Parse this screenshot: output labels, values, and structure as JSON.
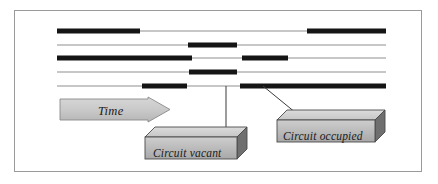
{
  "figure": {
    "type": "timeline-occupancy-diagram",
    "background": "#ffffff",
    "frame": {
      "x": 14,
      "y": 10,
      "width": 408,
      "height": 162,
      "border_color": "#9a9a9a"
    }
  },
  "colors": {
    "occupied": "#151515",
    "vacant": "#b4b4b4",
    "callout_face": "#b9b9b9",
    "callout_top": "#d2d2d2",
    "callout_side": "#6f6f6f",
    "callout_outline": "#4a4a4a",
    "arrow_fill": "#c9c9c9",
    "arrow_outline": "#8a8a8a",
    "leader": "#3a3a3a",
    "text": "#1a1a1a"
  },
  "timeline": {
    "x_start": 57,
    "x_end": 386,
    "thin_width": 1.4,
    "thick_width": 5.0,
    "rows": [
      {
        "id": "circuit-1",
        "y": 31,
        "segments": [
          {
            "state": "occupied",
            "x1": 57,
            "x2": 140
          },
          {
            "state": "vacant",
            "x1": 140,
            "x2": 307
          },
          {
            "state": "occupied",
            "x1": 307,
            "x2": 386
          }
        ]
      },
      {
        "id": "circuit-2",
        "y": 45,
        "segments": [
          {
            "state": "vacant",
            "x1": 57,
            "x2": 188
          },
          {
            "state": "occupied",
            "x1": 188,
            "x2": 237
          },
          {
            "state": "vacant",
            "x1": 237,
            "x2": 386
          }
        ]
      },
      {
        "id": "circuit-3",
        "y": 58,
        "segments": [
          {
            "state": "occupied",
            "x1": 57,
            "x2": 192
          },
          {
            "state": "vacant",
            "x1": 192,
            "x2": 242
          },
          {
            "state": "occupied",
            "x1": 242,
            "x2": 288
          },
          {
            "state": "vacant",
            "x1": 288,
            "x2": 386
          }
        ]
      },
      {
        "id": "circuit-4",
        "y": 72,
        "segments": [
          {
            "state": "vacant",
            "x1": 57,
            "x2": 189
          },
          {
            "state": "occupied",
            "x1": 189,
            "x2": 237
          },
          {
            "state": "vacant",
            "x1": 237,
            "x2": 386
          }
        ]
      },
      {
        "id": "circuit-5",
        "y": 86,
        "segments": [
          {
            "state": "vacant",
            "x1": 57,
            "x2": 142
          },
          {
            "state": "occupied",
            "x1": 142,
            "x2": 187
          },
          {
            "state": "vacant",
            "x1": 187,
            "x2": 240
          },
          {
            "state": "occupied",
            "x1": 240,
            "x2": 386
          }
        ]
      }
    ]
  },
  "time_arrow": {
    "label": "Time",
    "x": 60,
    "y": 99,
    "width": 110,
    "height": 21,
    "head_width": 22,
    "text_x": 98,
    "text_y": 105
  },
  "callouts": [
    {
      "id": "circuit-vacant",
      "label": "Circuit vacant",
      "box": {
        "x": 145,
        "y": 137,
        "width": 92,
        "height": 22,
        "depth": 10
      },
      "text_x": 153,
      "text_y": 148,
      "leader": {
        "x1": 226,
        "y1": 137,
        "x2": 226,
        "y2": 86
      }
    },
    {
      "id": "circuit-occupied",
      "label": "Circuit occupied",
      "box": {
        "x": 277,
        "y": 120,
        "width": 98,
        "height": 22,
        "depth": 10
      },
      "text_x": 283,
      "text_y": 131,
      "leader": {
        "x1": 296,
        "y1": 113,
        "x2": 263,
        "y2": 86
      }
    }
  ]
}
